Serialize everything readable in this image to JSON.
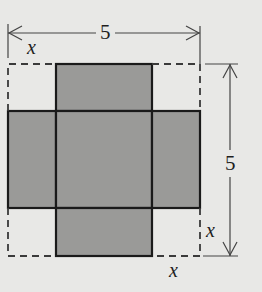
{
  "diagram": {
    "type": "box-net-cutout",
    "colors": {
      "background": "#e8e8e6",
      "fill": "#9a9a98",
      "stroke": "#1a1a1a",
      "dimension_line": "#444444"
    },
    "outer_square": {
      "side_label": "5",
      "style": "dashed"
    },
    "corner_cutouts": {
      "side_label": "x",
      "count": 4
    },
    "labels": {
      "top_dimension": "5",
      "right_dimension": "5",
      "top_left_cut": "x",
      "bottom_right_cut_vertical": "x",
      "bottom_right_cut_horizontal": "x"
    }
  }
}
